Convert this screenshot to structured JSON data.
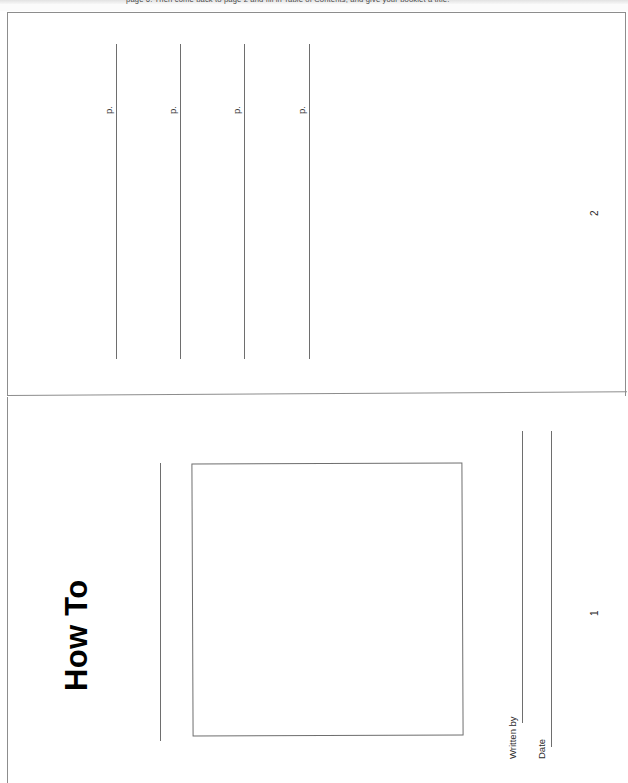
{
  "document": {
    "kind": "scanned-worksheet",
    "orientation": "landscape-rotated-90",
    "paper_color": "#ffffff",
    "ink_color": "#1a1a1a",
    "rule_color": "#6e6e6e"
  },
  "instruction_strip": {
    "text": "page 6. Then come back to page 2 and fill in Table of Contents, and give your booklet a title."
  },
  "toc_page": {
    "title": "Table of Contents",
    "page_number": "2",
    "entries": [
      {
        "page_label": "p."
      },
      {
        "page_label": "p."
      },
      {
        "page_label": "p."
      },
      {
        "page_label": "p."
      }
    ]
  },
  "cover_page": {
    "title": "How To",
    "page_number": "1",
    "art_box_label": "illustration-box",
    "fields": [
      {
        "label": "Written by",
        "value": ""
      },
      {
        "label": "Date",
        "value": ""
      }
    ]
  }
}
